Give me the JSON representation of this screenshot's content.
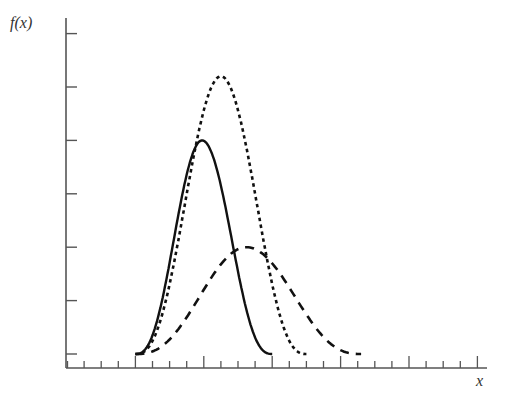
{
  "chart_data": {
    "type": "line",
    "title": "",
    "xlabel": "x",
    "ylabel": "f(x)",
    "xlim": [
      0,
      25
    ],
    "ylim": [
      0,
      6.3
    ],
    "x_ticks_major_every": 4,
    "x_ticks_minor_every": 1,
    "y_ticks": [
      0,
      1,
      2,
      3,
      4,
      5,
      6
    ],
    "tick_labels_shown": false,
    "grid": false,
    "legend": null,
    "series": [
      {
        "name": "solid",
        "style": "solid",
        "shape": "bell",
        "support": [
          4,
          12
        ],
        "peak_x": 7.9,
        "peak_y": 4.0
      },
      {
        "name": "dotted",
        "style": "dotted",
        "shape": "bell",
        "support": [
          4,
          14
        ],
        "peak_x": 9.0,
        "peak_y": 5.2
      },
      {
        "name": "dashed",
        "style": "dashed",
        "shape": "bell",
        "support": [
          4,
          17.2
        ],
        "peak_x": 10.5,
        "peak_y": 2.0
      }
    ]
  },
  "colors": {
    "axis": "#555555",
    "curve": "#111111"
  }
}
